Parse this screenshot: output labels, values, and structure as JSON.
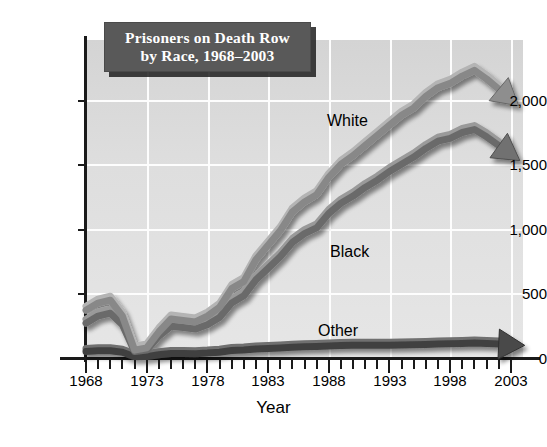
{
  "title": {
    "line1": "Prisoners on Death Row",
    "line2": "by Race, 1968–2003"
  },
  "axis": {
    "x_title": "Year",
    "y_ticks": [
      "0",
      "500",
      "1,000",
      "1,500",
      "2,000"
    ],
    "x_ticks": [
      "1968",
      "1973",
      "1978",
      "1983",
      "1988",
      "1993",
      "1998",
      "2003"
    ]
  },
  "series_labels": {
    "white": "White",
    "black": "Black",
    "other": "Other"
  },
  "colors": {
    "title_box": "#595959",
    "title_text": "#ffffff",
    "plot_background": "#dedede",
    "gridline": "#fdfdfd",
    "axis": "#1a1a1a",
    "white_series": "#8c8c8c",
    "black_series": "#6e6e6e",
    "other_series": "#4a4a4a"
  },
  "chart_data": {
    "type": "line",
    "title": "Prisoners on Death Row by Race, 1968–2003",
    "xlabel": "Year",
    "ylabel": "",
    "xlim": [
      1968,
      2004
    ],
    "ylim": [
      0,
      2200
    ],
    "grid": true,
    "legend": "inline-labels",
    "x": [
      1968,
      1969,
      1970,
      1971,
      1972,
      1973,
      1974,
      1975,
      1976,
      1977,
      1978,
      1979,
      1980,
      1981,
      1982,
      1983,
      1984,
      1985,
      1986,
      1987,
      1988,
      1989,
      1990,
      1991,
      1992,
      1993,
      1994,
      1995,
      1996,
      1997,
      1998,
      1999,
      2000,
      2001,
      2002,
      2003
    ],
    "series": [
      {
        "name": "White",
        "label_text": "White",
        "values": [
          330,
          380,
          400,
          290,
          55,
          70,
          180,
          270,
          260,
          250,
          290,
          350,
          480,
          530,
          680,
          780,
          880,
          1010,
          1080,
          1130,
          1250,
          1340,
          1400,
          1470,
          1540,
          1610,
          1680,
          1730,
          1810,
          1870,
          1900,
          1950,
          1990,
          1930,
          1860,
          1870
        ]
      },
      {
        "name": "Black",
        "label_text": "Black",
        "values": [
          240,
          290,
          310,
          230,
          45,
          55,
          150,
          220,
          210,
          200,
          230,
          280,
          380,
          430,
          540,
          620,
          700,
          800,
          860,
          900,
          1000,
          1070,
          1120,
          1180,
          1230,
          1290,
          1340,
          1390,
          1450,
          1500,
          1520,
          1560,
          1580,
          1530,
          1470,
          1480
        ]
      },
      {
        "name": "Other",
        "label_text": "Other",
        "values": [
          45,
          50,
          50,
          40,
          8,
          10,
          22,
          32,
          32,
          30,
          34,
          40,
          52,
          55,
          62,
          66,
          70,
          74,
          78,
          80,
          84,
          86,
          88,
          88,
          88,
          88,
          90,
          92,
          94,
          96,
          98,
          100,
          104,
          100,
          96,
          98
        ]
      }
    ],
    "annotations": [
      {
        "text": "White",
        "x": 1990,
        "y": 1790
      },
      {
        "text": "Black",
        "x": 1990,
        "y": 880
      },
      {
        "text": "Other",
        "x": 1989,
        "y": 270
      }
    ]
  }
}
